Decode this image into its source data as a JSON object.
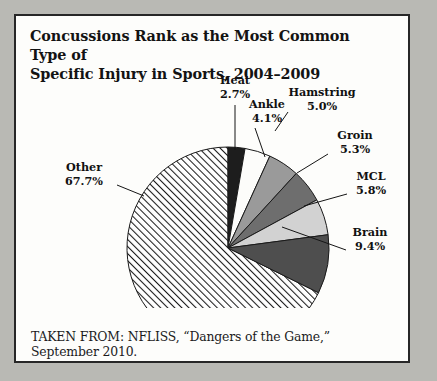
{
  "figure": {
    "title_line1": "Concussions Rank as the Most Common Type of",
    "title_line2": "Specific Injury in Sports, 2004–2009",
    "source_note": "TAKEN FROM: NFLISS, “Dangers of the Game,” September 2010."
  },
  "chart_data": {
    "type": "pie",
    "title": "Concussions Rank as the Most Common Type of Specific Injury in Sports, 2004–2009",
    "xlabel": "",
    "ylabel": "",
    "units": "percent",
    "start_angle_deg": 0,
    "direction": "clockwise",
    "legend": "none",
    "grid": false,
    "categories": [
      "Heat",
      "Ankle",
      "Hamstring",
      "Groin",
      "MCL",
      "Brain",
      "Other"
    ],
    "values": [
      2.7,
      4.1,
      5.0,
      5.3,
      5.8,
      9.4,
      67.7
    ],
    "slices": [
      {
        "name": "Heat",
        "value": 2.7,
        "label": "Heat",
        "value_label": "2.7%",
        "fill": "#1d1d1d",
        "pattern": "solid"
      },
      {
        "name": "Ankle",
        "value": 4.1,
        "label": "Ankle",
        "value_label": "4.1%",
        "fill": "#fcfcfa",
        "pattern": "solid"
      },
      {
        "name": "Hamstring",
        "value": 5.0,
        "label": "Hamstring",
        "value_label": "5.0%",
        "fill": "#9a9a9a",
        "pattern": "solid"
      },
      {
        "name": "Groin",
        "value": 5.3,
        "label": "Groin",
        "value_label": "5.3%",
        "fill": "#6e6e6e",
        "pattern": "solid"
      },
      {
        "name": "MCL",
        "value": 5.8,
        "label": "MCL",
        "value_label": "5.8%",
        "fill": "#d2d2d2",
        "pattern": "solid"
      },
      {
        "name": "Brain",
        "value": 9.4,
        "label": "Brain",
        "value_label": "9.4%",
        "fill": "#4e4e4e",
        "pattern": "solid"
      },
      {
        "name": "Other",
        "value": 67.7,
        "label": "Other",
        "value_label": "67.7%",
        "fill": "#ffffff",
        "pattern": "diagonal-hatch"
      }
    ]
  },
  "labels": {
    "heat": {
      "name": "Heat",
      "pct": "2.7%"
    },
    "ankle": {
      "name": "Ankle",
      "pct": "4.1%"
    },
    "hamstring": {
      "name": "Hamstring",
      "pct": "5.0%"
    },
    "groin": {
      "name": "Groin",
      "pct": "5.3%"
    },
    "mcl": {
      "name": "MCL",
      "pct": "5.8%"
    },
    "brain": {
      "name": "Brain",
      "pct": "9.4%"
    },
    "other": {
      "name": "Other",
      "pct": "67.7%"
    }
  },
  "colors": {
    "page_background": "#b9b9b4",
    "panel_background": "#fdfdfb",
    "panel_border": "#272727",
    "text": "#131313"
  }
}
